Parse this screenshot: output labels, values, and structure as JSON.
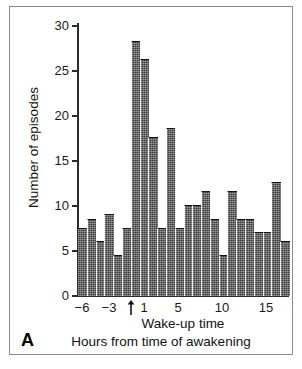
{
  "figure": {
    "panel_label": "A",
    "accent_color": "#3c3c3c",
    "frame_color": "#8a8a8a"
  },
  "chart_data": {
    "type": "bar",
    "title": "",
    "subtitle": "",
    "xlabel": "Hours from time of awakening",
    "xlabel_secondary": "Wake-up time",
    "ylabel": "Number of episodes",
    "xlim": [
      -7,
      18
    ],
    "ylim": [
      0,
      30
    ],
    "grid": false,
    "legend": null,
    "bin_width": 1,
    "annotations": [
      {
        "name": "wake-up-arrow",
        "text": "↑",
        "x": 0,
        "note": "arrow marks wake-up time (hour 0)"
      }
    ],
    "x_ticks": [
      -6,
      -3,
      1,
      5,
      10,
      15
    ],
    "x_tick_labels": [
      "−6",
      "−3",
      "1",
      "5",
      "10",
      "15"
    ],
    "y_ticks": [
      0,
      5,
      10,
      15,
      20,
      25,
      30
    ],
    "y_tick_labels": [
      "0",
      "5",
      "10",
      "15",
      "20",
      "25",
      "30"
    ],
    "categories": [
      -6,
      -5,
      -4,
      -3,
      -2,
      -1,
      0,
      1,
      2,
      3,
      4,
      5,
      6,
      7,
      8,
      9,
      10,
      11,
      12,
      13,
      14,
      15,
      16,
      17
    ],
    "values": [
      7.5,
      8.5,
      6,
      9,
      4.5,
      7.5,
      28,
      26,
      17.5,
      7.5,
      18.5,
      7.5,
      10,
      10,
      11.5,
      8.5,
      4.5,
      11.5,
      8.5,
      8.5,
      7,
      7,
      12.5,
      6
    ]
  }
}
